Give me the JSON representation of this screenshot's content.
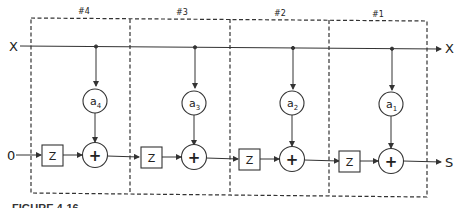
{
  "diagram": {
    "input_x_label": "X",
    "output_x_label": "X",
    "input_zero_label": "0",
    "output_label": "S",
    "delay_label": "Z",
    "adder_symbol": "+",
    "stages": [
      {
        "id": "#4",
        "coef": "a",
        "sub": "4"
      },
      {
        "id": "#3",
        "coef": "a",
        "sub": "3"
      },
      {
        "id": "#2",
        "coef": "a",
        "sub": "2"
      },
      {
        "id": "#1",
        "coef": "a",
        "sub": "1"
      }
    ],
    "caption": "FIGURE 4-16",
    "colors": {
      "line": "#333333",
      "dash": "#333333",
      "background": "#ffffff"
    }
  }
}
